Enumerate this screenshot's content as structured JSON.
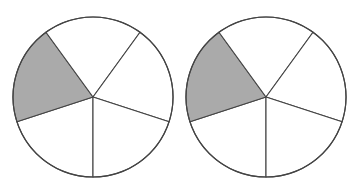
{
  "figure": {
    "stroke_color": "#444444",
    "fill_shaded": "#aaaaaa",
    "fill_unshaded": "#ffffff",
    "circles": [
      {
        "id": "left",
        "cx": 93,
        "cy": 97,
        "r": 80,
        "sectors": 5,
        "shaded_sectors": 1,
        "start_angle_deg": 90
      },
      {
        "id": "right",
        "cx": 266,
        "cy": 97,
        "r": 80,
        "sectors": 5,
        "shaded_sectors": 1,
        "start_angle_deg": 90
      }
    ]
  }
}
